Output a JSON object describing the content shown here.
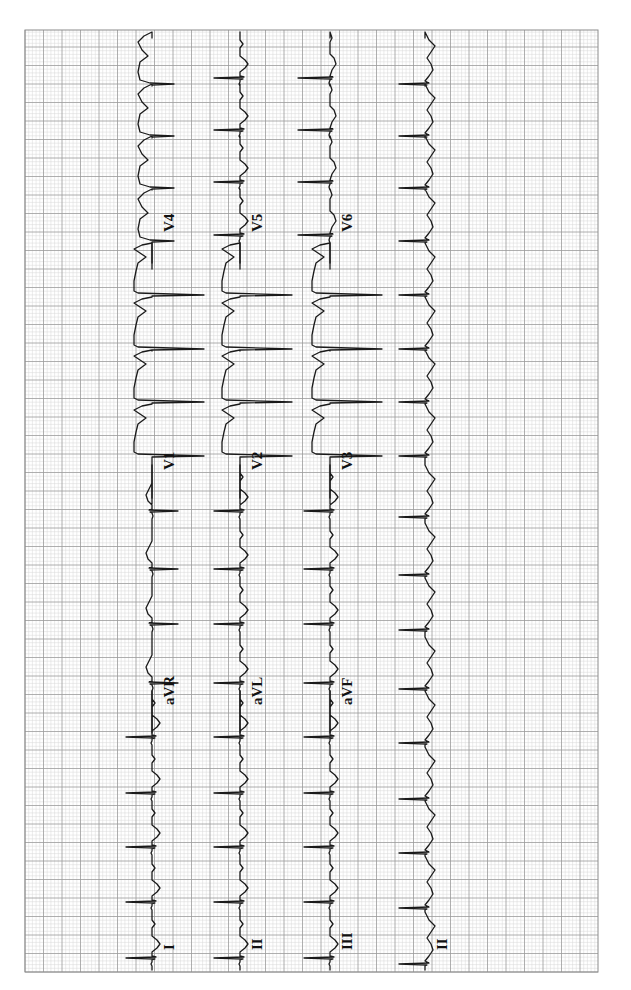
{
  "chart_data": {
    "type": "line",
    "orientation": "rotated-90-ccw",
    "grid": {
      "on": true,
      "left": 25,
      "top": 30,
      "right": 598,
      "bottom": 972,
      "minor_step_px": 3.7,
      "major_step_px": 18.5,
      "minor_color": "#d9d9d9",
      "major_color": "#9a9a9a",
      "border_color": "#8c8c8c"
    },
    "layout": "3x4 + rhythm strip",
    "rows": [
      {
        "baseline_x": 152,
        "segments": [
          {
            "lead": "I",
            "y_start": 972,
            "y_end": 735,
            "label_y": 950,
            "beat_style": "small_upright"
          },
          {
            "lead": "aVR",
            "y_start": 735,
            "y_end": 500,
            "label_y": 705,
            "beat_style": "inverted"
          },
          {
            "lead": "V1",
            "y_start": 500,
            "y_end": 265,
            "label_y": 470,
            "beat_style": "deep_qs"
          },
          {
            "lead": "V4",
            "y_start": 265,
            "y_end": 30,
            "label_y": 232,
            "beat_style": "deep_qs_small"
          }
        ]
      },
      {
        "baseline_x": 240,
        "segments": [
          {
            "lead": "II",
            "y_start": 972,
            "y_end": 735,
            "label_y": 950,
            "beat_style": "small_upright"
          },
          {
            "lead": "aVL",
            "y_start": 735,
            "y_end": 500,
            "label_y": 705,
            "beat_style": "small_upright"
          },
          {
            "lead": "V2",
            "y_start": 500,
            "y_end": 265,
            "label_y": 470,
            "beat_style": "deep_qs"
          },
          {
            "lead": "V5",
            "y_start": 265,
            "y_end": 30,
            "label_y": 232,
            "beat_style": "small_upright"
          }
        ]
      },
      {
        "baseline_x": 330,
        "segments": [
          {
            "lead": "III",
            "y_start": 972,
            "y_end": 735,
            "label_y": 950,
            "beat_style": "small_upright"
          },
          {
            "lead": "aVF",
            "y_start": 735,
            "y_end": 500,
            "label_y": 705,
            "beat_style": "small_upright"
          },
          {
            "lead": "V3",
            "y_start": 500,
            "y_end": 265,
            "label_y": 470,
            "beat_style": "deep_qs"
          },
          {
            "lead": "V6",
            "y_start": 265,
            "y_end": 30,
            "label_y": 232,
            "beat_style": "upright"
          }
        ]
      },
      {
        "baseline_x": 425,
        "segments": [
          {
            "lead": "II",
            "y_start": 972,
            "y_end": 30,
            "label_y": 950,
            "beat_style": "rhythm"
          }
        ]
      }
    ],
    "rhythm_strip": {
      "lead": "II",
      "qrs_y_positions": [
        960,
        904,
        849,
        795,
        739,
        685,
        626,
        571,
        513,
        452,
        398,
        345,
        291,
        237,
        184,
        132,
        80
      ]
    },
    "beat_spacing_px": 54,
    "approx_rr_large_boxes": 2.9,
    "leads": [
      "I",
      "II",
      "III",
      "aVR",
      "aVL",
      "aVF",
      "V1",
      "V2",
      "V3",
      "V4",
      "V5",
      "V6",
      "II"
    ],
    "xlabel": "",
    "ylabel": "",
    "legend": "none"
  },
  "labels": {
    "row1": [
      "I",
      "aVR",
      "V1",
      "V4"
    ],
    "row2": [
      "II",
      "aVL",
      "V2",
      "V5"
    ],
    "row3": [
      "III",
      "aVF",
      "V3",
      "V6"
    ],
    "row4": [
      "II"
    ]
  }
}
